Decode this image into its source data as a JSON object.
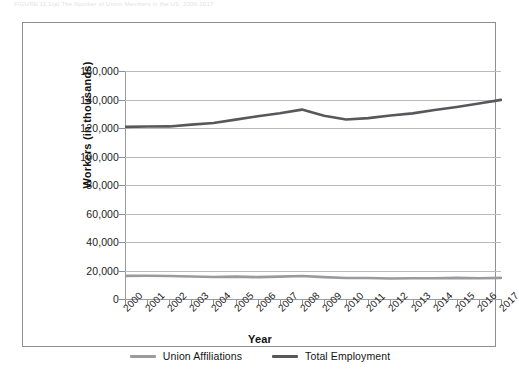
{
  "caption": {
    "text": "FIGURE 11.1(a)  The Number of Union Members in the US: 2000-2017"
  },
  "chart_data": {
    "type": "line",
    "title": "",
    "xlabel": "Year",
    "ylabel": "Workers (in thousands)",
    "categories": [
      "2000",
      "2001",
      "2002",
      "2003",
      "2004",
      "2005",
      "2006",
      "2007",
      "2008",
      "2009",
      "2010",
      "2011",
      "2012",
      "2013",
      "2014",
      "2015",
      "2016",
      "2017"
    ],
    "ylim": [
      0,
      160000
    ],
    "yticks": [
      "0",
      "20,000",
      "40,000",
      "60,000",
      "80,000",
      "100,000",
      "120,000",
      "140,000",
      "160,000"
    ],
    "ytick_values": [
      0,
      20000,
      40000,
      60000,
      80000,
      100000,
      120000,
      140000,
      160000
    ],
    "grid": true,
    "legend_position": "bottom",
    "series": [
      {
        "name": "Union Affiliations",
        "color": "#9a9a9f",
        "values": [
          16258,
          16275,
          16145,
          15776,
          15472,
          15685,
          15359,
          15670,
          16098,
          15327,
          14715,
          14764,
          14366,
          14528,
          14576,
          14795,
          14600,
          14817
        ]
      },
      {
        "name": "Total Employment",
        "color": "#58585c",
        "values": [
          120786,
          121013,
          121106,
          122358,
          123554,
          125889,
          128247,
          130328,
          132904,
          128633,
          125928,
          126906,
          128818,
          130282,
          132587,
          134763,
          137152,
          139751
        ]
      }
    ]
  },
  "legend": {
    "items": [
      {
        "label": "Union Affiliations",
        "color": "#9a9a9f"
      },
      {
        "label": "Total Employment",
        "color": "#58585c"
      }
    ]
  }
}
